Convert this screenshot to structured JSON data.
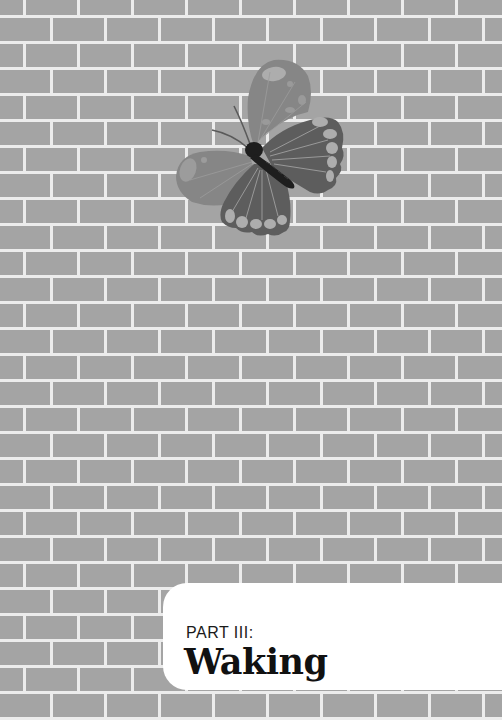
{
  "page": {
    "type": "part-title-page",
    "background": {
      "pattern": "brick-wall",
      "brick_color": "#a4a4a4",
      "mortar_color": "#ececec",
      "brick_width": 54,
      "brick_height": 26,
      "mortar_width": 3
    },
    "illustration": {
      "subject": "butterfly",
      "colors": {
        "upper_wing": "#868686",
        "lower_wing": "#5d5d5d",
        "spots": "#adadad",
        "body": "#1e1e1e",
        "veins": "#b0b0b0"
      }
    },
    "title_panel": {
      "part_label": "PART III:",
      "title": "Waking",
      "background": "#ffffff"
    }
  }
}
